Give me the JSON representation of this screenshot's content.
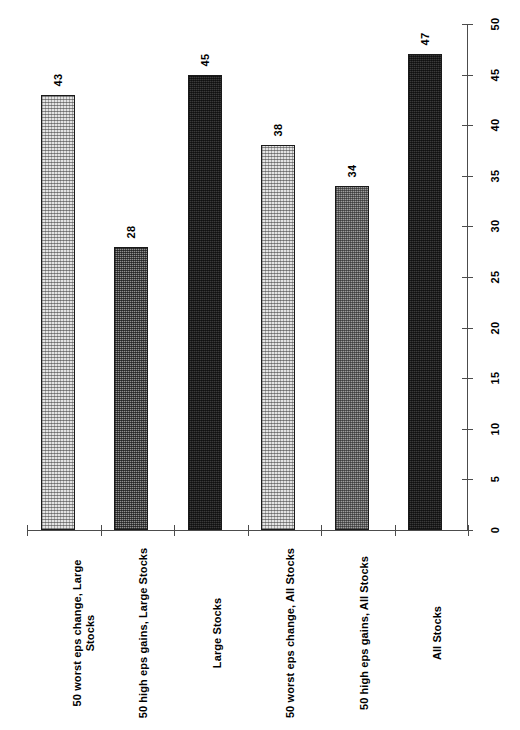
{
  "chart_data": {
    "type": "bar",
    "title": "",
    "subtitle": "",
    "xlabel": "",
    "ylabel": "",
    "orientation": "rotated-90",
    "grid": false,
    "legend": "none",
    "ylim": [
      0,
      50
    ],
    "ytick_step": 5,
    "categories": [
      "50 worst eps change, Large\nStocks",
      "50 high eps gains, Large Stocks",
      "Large Stocks",
      "50 worst eps change, All Stocks",
      "50 high eps gains, All Stocks",
      "All Stocks"
    ],
    "values": [
      43,
      28,
      45,
      38,
      34,
      47
    ],
    "value_labels": [
      "43",
      "28",
      "45",
      "38",
      "34",
      "47"
    ],
    "ticks": [
      "0",
      "5",
      "10",
      "15",
      "20",
      "25",
      "30",
      "35",
      "40",
      "45",
      "50"
    ],
    "bar_patterns": [
      "light-dot",
      "mid-check",
      "dark",
      "light-dot",
      "mid-light-check",
      "dark"
    ],
    "colors": {
      "light_dot": "#e3e3e3",
      "mid_check": "#8f8f8f",
      "mid_light_check": "#9d9d9d",
      "dark": "#3a3a3a",
      "axis": "#4c4c4c",
      "bar_outline": "#1a1a1a",
      "text": "#000000",
      "background": "#ffffff"
    }
  }
}
